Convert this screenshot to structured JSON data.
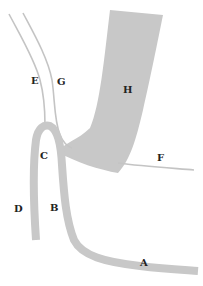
{
  "diagram": {
    "type": "anatomical schematic",
    "colors": {
      "band_fill": "#c8c8c8",
      "line_stroke": "#c4c4c4",
      "label_color": "#222222",
      "background": "#ffffff"
    },
    "labels": [
      {
        "id": "A",
        "text": "A",
        "x": 140,
        "y": 258
      },
      {
        "id": "B",
        "text": "B",
        "x": 50,
        "y": 203
      },
      {
        "id": "C",
        "text": "C",
        "x": 40,
        "y": 151
      },
      {
        "id": "D",
        "text": "D",
        "x": 14,
        "y": 204
      },
      {
        "id": "E",
        "text": "E",
        "x": 31,
        "y": 76
      },
      {
        "id": "F",
        "text": "F",
        "x": 157,
        "y": 153
      },
      {
        "id": "G",
        "text": "G",
        "x": 57,
        "y": 77
      },
      {
        "id": "H",
        "text": "H",
        "x": 123,
        "y": 85
      }
    ],
    "shapes": [
      {
        "id": "E",
        "kind": "thin-line",
        "description": "upper-left thin line descending to C"
      },
      {
        "id": "G",
        "kind": "thin-line",
        "description": "thin line curving toward base of H"
      },
      {
        "id": "F",
        "kind": "thin-line",
        "description": "horizontal thin line to the right of H"
      },
      {
        "id": "H",
        "kind": "wide-band",
        "description": "wide shaded band curving down-left"
      },
      {
        "id": "CDB",
        "kind": "band",
        "description": "inverted-U band: apex C, left leg D, right leg B continuing to A"
      }
    ]
  }
}
